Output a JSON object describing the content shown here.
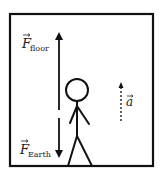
{
  "diagram": {
    "title": "",
    "colors": {
      "stroke": "#111111",
      "background": "#ffffff"
    },
    "labels": {
      "force_floor": {
        "main": "F",
        "subscript": "floor"
      },
      "force_earth": {
        "main": "F",
        "subscript": "Earth"
      },
      "acceleration": {
        "main": "a"
      }
    },
    "elements": [
      {
        "id": "elevator-box",
        "type": "rectangle"
      },
      {
        "id": "force-floor-arrow",
        "type": "arrow",
        "direction": "up",
        "style": "solid"
      },
      {
        "id": "force-earth-arrow",
        "type": "arrow",
        "direction": "down",
        "style": "solid"
      },
      {
        "id": "stick-figure",
        "type": "person"
      },
      {
        "id": "acceleration-arrow",
        "type": "arrow",
        "direction": "up",
        "style": "dashed"
      }
    ]
  }
}
